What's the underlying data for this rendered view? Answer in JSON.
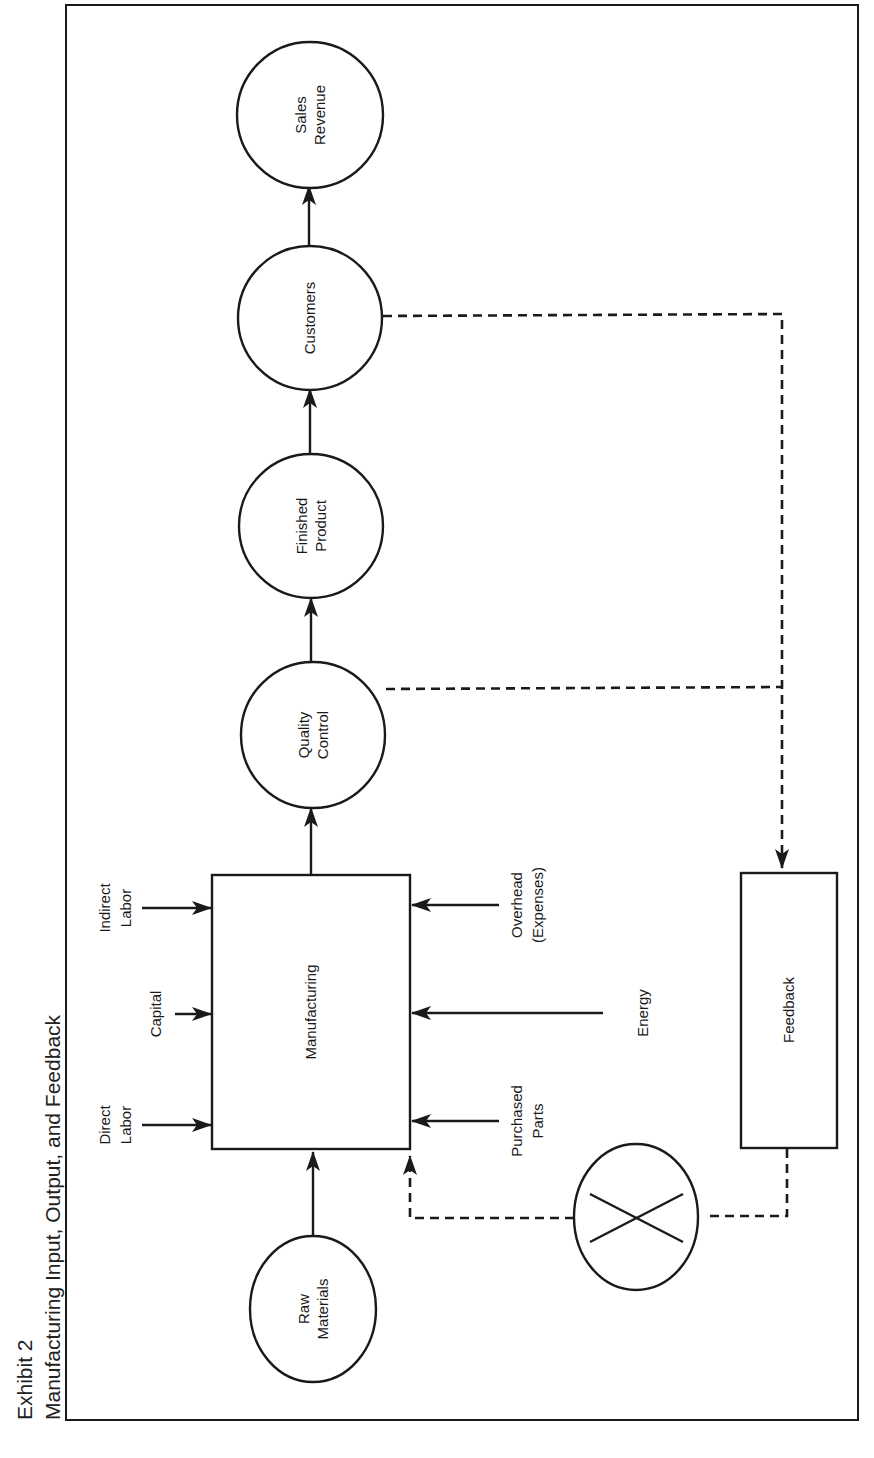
{
  "exhibit": {
    "number_label": "Exhibit 2",
    "title": "Manufacturing Input, Output, and Feedback"
  },
  "colors": {
    "line": "#1a1a1a",
    "background": "#ffffff"
  },
  "nodes": {
    "raw_materials": {
      "line1": "Raw",
      "line2": "Materials",
      "shape": "circle"
    },
    "manufacturing": {
      "label": "Manufacturing",
      "shape": "rectangle"
    },
    "quality_control": {
      "line1": "Quality",
      "line2": "Control",
      "shape": "circle"
    },
    "finished_product": {
      "line1": "Finished",
      "line2": "Product",
      "shape": "circle"
    },
    "customers": {
      "label": "Customers",
      "shape": "circle"
    },
    "sales_revenue": {
      "line1": "Sales",
      "line2": "Revenue",
      "shape": "circle"
    },
    "feedback": {
      "label": "Feedback",
      "shape": "rectangle"
    },
    "comparator": {
      "symbol": "X",
      "shape": "circle-with-cross"
    }
  },
  "inputs": {
    "direct_labor": {
      "line1": "Direct",
      "line2": "Labor"
    },
    "capital": {
      "label": "Capital"
    },
    "indirect_labor": {
      "line1": "Indirect",
      "line2": "Labor"
    },
    "purchased_parts": {
      "line1": "Purchased",
      "line2": "Parts"
    },
    "energy": {
      "label": "Energy"
    },
    "overhead": {
      "line1": "Overhead",
      "line2": "(Expenses)"
    }
  },
  "edges": [
    {
      "from": "Raw Materials",
      "to": "Manufacturing",
      "style": "solid"
    },
    {
      "from": "Direct Labor",
      "to": "Manufacturing",
      "style": "solid"
    },
    {
      "from": "Capital",
      "to": "Manufacturing",
      "style": "solid"
    },
    {
      "from": "Indirect Labor",
      "to": "Manufacturing",
      "style": "solid"
    },
    {
      "from": "Purchased Parts",
      "to": "Manufacturing",
      "style": "solid"
    },
    {
      "from": "Energy",
      "to": "Manufacturing",
      "style": "solid"
    },
    {
      "from": "Overhead (Expenses)",
      "to": "Manufacturing",
      "style": "solid"
    },
    {
      "from": "Manufacturing",
      "to": "Quality Control",
      "style": "solid"
    },
    {
      "from": "Quality Control",
      "to": "Finished Product",
      "style": "solid"
    },
    {
      "from": "Finished Product",
      "to": "Customers",
      "style": "solid"
    },
    {
      "from": "Customers",
      "to": "Sales Revenue",
      "style": "solid"
    },
    {
      "from": "Quality Control",
      "to": "Feedback",
      "style": "dashed"
    },
    {
      "from": "Customers",
      "to": "Feedback",
      "style": "dashed"
    },
    {
      "from": "Feedback",
      "to": "Comparator",
      "style": "dashed"
    },
    {
      "from": "Comparator",
      "to": "Manufacturing",
      "style": "dashed"
    }
  ]
}
